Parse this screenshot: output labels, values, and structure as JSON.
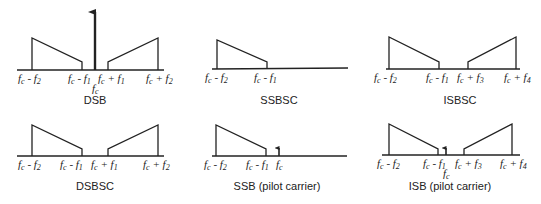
{
  "panels": [
    {
      "title": "DSB",
      "labels": [
        "f_c - f_2",
        "f_c - f_1",
        "f_c + f_1",
        "f_c + f_2",
        "f_c"
      ],
      "carrier": "full"
    },
    {
      "title": "SSBSC",
      "labels": [
        "f_c - f_2",
        "f_c - f_1"
      ],
      "carrier": "none"
    },
    {
      "title": "ISBSC",
      "labels": [
        "f_c - f_2",
        "f_c - f_1",
        "f_c + f_3",
        "f_c + f_4"
      ],
      "carrier": "none"
    },
    {
      "title": "DSBSC",
      "labels": [
        "f_c - f_2",
        "f_c - f_1",
        "f_c + f_1",
        "f_c + f_2"
      ],
      "carrier": "none"
    },
    {
      "title": "SSB (pilot carrier)",
      "labels": [
        "f_c - f_2",
        "f_c - f_1",
        "f_c"
      ],
      "carrier": "pilot"
    },
    {
      "title": "ISB (pilot carrier)",
      "labels": [
        "f_c - f_2",
        "f_c - f_1",
        "f_c + f_3",
        "f_c + f_4",
        "f_c"
      ],
      "carrier": "pilot"
    }
  ],
  "text": {
    "fc": "f",
    "c": "c",
    "minus": " - ",
    "plus": " + ",
    "s1": "1",
    "s2": "2",
    "s3": "3",
    "s4": "4",
    "t_dsb": "DSB",
    "t_ssbsc": "SSBSC",
    "t_isbsc": "ISBSC",
    "t_dsbsc": "DSBSC",
    "t_ssbp": "SSB (pilot carrier)",
    "t_isbp": "ISB (pilot carrier)"
  }
}
